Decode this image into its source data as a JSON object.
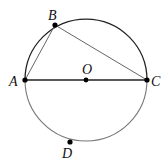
{
  "diagram": {
    "type": "circle-geometry",
    "circle": {
      "center": "O",
      "cx": 86,
      "cy": 80,
      "r": 61
    },
    "points": [
      {
        "id": "A",
        "label": "A",
        "x": 25,
        "y": 80,
        "label_x": 9,
        "label_y": 86
      },
      {
        "id": "B",
        "label": "B",
        "x": 55,
        "y": 25,
        "label_x": 48,
        "label_y": 20
      },
      {
        "id": "O",
        "label": "O",
        "x": 86,
        "y": 80,
        "label_x": 82,
        "label_y": 74
      },
      {
        "id": "C",
        "label": "C",
        "x": 147,
        "y": 80,
        "label_x": 151,
        "label_y": 86
      },
      {
        "id": "D",
        "label": "D",
        "x": 70,
        "y": 142,
        "label_x": 62,
        "label_y": 158
      }
    ],
    "segments": [
      {
        "from": "A",
        "to": "C",
        "name": "diameter-AC"
      },
      {
        "from": "A",
        "to": "B",
        "name": "chord-AB"
      },
      {
        "from": "B",
        "to": "C",
        "name": "chord-BC"
      }
    ],
    "colors": {
      "upper_arc": "#222222",
      "lower_arc": "#777777",
      "diameter": "#222222",
      "chords": "#666666",
      "points": "#000000"
    }
  },
  "labels": {
    "A": "A",
    "B": "B",
    "O": "O",
    "C": "C",
    "D": "D"
  }
}
